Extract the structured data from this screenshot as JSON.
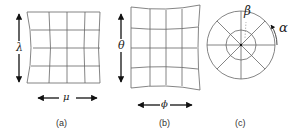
{
  "panels": [
    {
      "id": "a",
      "caption": "(a)",
      "vertical_label": "λ",
      "horizontal_label": "μ"
    },
    {
      "id": "b",
      "caption": "(b)",
      "vertical_label": "θ",
      "horizontal_label": "ϕ"
    },
    {
      "id": "c",
      "caption": "(c)",
      "radial_label": "β",
      "angular_label": "α"
    }
  ],
  "colors": {
    "line": "#555555",
    "arrow": "#111111",
    "background": "#ffffff"
  }
}
